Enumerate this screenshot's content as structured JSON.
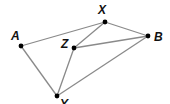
{
  "diagram": {
    "type": "graph",
    "edge_color": "#8a8a8a",
    "node_color": "#000000",
    "points": [
      {
        "id": "A",
        "label": "A",
        "x": 21,
        "y": 46,
        "lx": 11,
        "ly": 40
      },
      {
        "id": "X",
        "label": "X",
        "x": 105,
        "y": 22,
        "lx": 98,
        "ly": 14
      },
      {
        "id": "B",
        "label": "B",
        "x": 148,
        "y": 36,
        "lx": 154,
        "ly": 41
      },
      {
        "id": "Z",
        "label": "Z",
        "x": 74,
        "y": 48,
        "lx": 61,
        "ly": 48
      },
      {
        "id": "Y",
        "label": "Y",
        "x": 57,
        "y": 96,
        "lx": 60,
        "ly": 108
      }
    ],
    "edges": [
      [
        "A",
        "X"
      ],
      [
        "X",
        "B"
      ],
      [
        "A",
        "Y"
      ],
      [
        "Z",
        "X"
      ],
      [
        "Z",
        "B"
      ],
      [
        "Z",
        "Y"
      ],
      [
        "Y",
        "B"
      ]
    ]
  }
}
